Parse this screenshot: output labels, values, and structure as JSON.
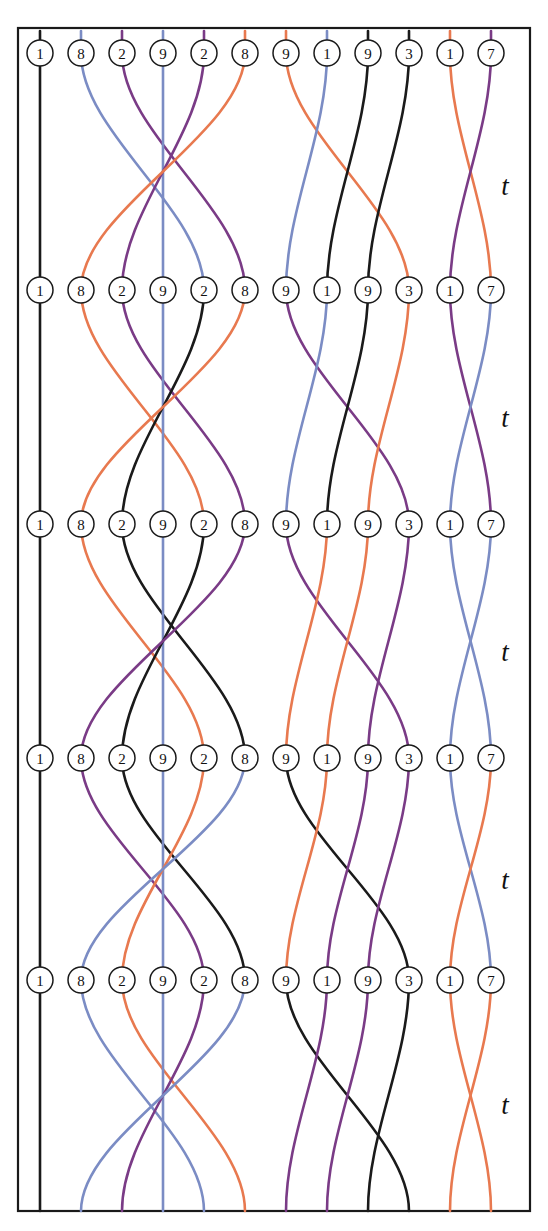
{
  "figure": {
    "width": 548,
    "height": 1231,
    "background": "#ffffff",
    "frame": {
      "x": 18,
      "y": 28,
      "width": 512,
      "height": 1183,
      "stroke": "#1a1a1a"
    }
  },
  "palette": {
    "black": "#1a1a1a",
    "blue": "#7b8cc4",
    "purple": "#7a3b86",
    "orange": "#e8794f"
  },
  "layout": {
    "columns_x": [
      40,
      81,
      122,
      163,
      204,
      245,
      286,
      327,
      368,
      409,
      450,
      491
    ],
    "rows_y": [
      53,
      290,
      524,
      758,
      980
    ],
    "column_count": 12,
    "row_count": 5,
    "node_radius": 13
  },
  "time_labels": [
    {
      "text": "t",
      "x": 505,
      "y": 186
    },
    {
      "text": "t",
      "x": 505,
      "y": 418
    },
    {
      "text": "t",
      "x": 505,
      "y": 652
    },
    {
      "text": "t",
      "x": 505,
      "y": 880
    },
    {
      "text": "t",
      "x": 505,
      "y": 1105
    }
  ],
  "node_values": [
    "1",
    "8",
    "2",
    "9",
    "2",
    "8",
    "9",
    "1",
    "9",
    "3",
    "1",
    "7"
  ],
  "rows": [
    {
      "index": 0,
      "y": 53,
      "labels": [
        "1",
        "8",
        "2",
        "9",
        "2",
        "8",
        "9",
        "1",
        "9",
        "3",
        "1",
        "7"
      ],
      "strand_colors": [
        "black",
        "blue",
        "purple",
        "blue",
        "purple",
        "orange",
        "orange",
        "blue",
        "black",
        "black",
        "orange",
        "purple"
      ]
    },
    {
      "index": 1,
      "y": 290,
      "labels": [
        "1",
        "8",
        "2",
        "9",
        "2",
        "8",
        "9",
        "1",
        "9",
        "3",
        "1",
        "7"
      ],
      "strand_colors": [
        "black",
        "orange",
        "purple",
        "blue",
        "black",
        "orange",
        "purple",
        "blue",
        "black",
        "orange",
        "purple",
        "blue"
      ]
    },
    {
      "index": 2,
      "y": 524,
      "labels": [
        "1",
        "8",
        "2",
        "9",
        "2",
        "8",
        "9",
        "1",
        "9",
        "3",
        "1",
        "7"
      ],
      "strand_colors": [
        "black",
        "orange",
        "black",
        "blue",
        "black",
        "purple",
        "purple",
        "orange",
        "orange",
        "purple",
        "blue",
        "blue"
      ]
    },
    {
      "index": 3,
      "y": 758,
      "labels": [
        "1",
        "8",
        "2",
        "9",
        "2",
        "8",
        "9",
        "1",
        "9",
        "3",
        "1",
        "7"
      ],
      "strand_colors": [
        "black",
        "purple",
        "black",
        "blue",
        "orange",
        "blue",
        "black",
        "orange",
        "purple",
        "purple",
        "blue",
        "orange"
      ]
    },
    {
      "index": 4,
      "y": 980,
      "labels": [
        "1",
        "8",
        "2",
        "9",
        "2",
        "8",
        "9",
        "1",
        "9",
        "3",
        "1",
        "7"
      ],
      "strand_colors": [
        "black",
        "blue",
        "orange",
        "blue",
        "purple",
        "blue",
        "black",
        "purple",
        "purple",
        "black",
        "orange",
        "orange"
      ]
    }
  ],
  "segments": [
    {
      "index": 0,
      "y_top": 53,
      "y_bottom": 290,
      "strands": [
        {
          "from": 0,
          "to": 0,
          "color": "black"
        },
        {
          "from": 1,
          "to": 4,
          "color": "blue"
        },
        {
          "from": 2,
          "to": 5,
          "color": "purple"
        },
        {
          "from": 3,
          "to": 3,
          "color": "blue"
        },
        {
          "from": 4,
          "to": 2,
          "color": "purple"
        },
        {
          "from": 5,
          "to": 1,
          "color": "orange"
        },
        {
          "from": 6,
          "to": 9,
          "color": "orange"
        },
        {
          "from": 7,
          "to": 6,
          "color": "blue"
        },
        {
          "from": 8,
          "to": 7,
          "color": "black"
        },
        {
          "from": 9,
          "to": 8,
          "color": "black"
        },
        {
          "from": 10,
          "to": 11,
          "color": "orange"
        },
        {
          "from": 11,
          "to": 10,
          "color": "purple"
        }
      ]
    },
    {
      "index": 1,
      "y_top": 290,
      "y_bottom": 524,
      "strands": [
        {
          "from": 0,
          "to": 0,
          "color": "black"
        },
        {
          "from": 1,
          "to": 4,
          "color": "orange"
        },
        {
          "from": 2,
          "to": 5,
          "color": "purple"
        },
        {
          "from": 3,
          "to": 3,
          "color": "blue"
        },
        {
          "from": 4,
          "to": 2,
          "color": "black"
        },
        {
          "from": 5,
          "to": 1,
          "color": "orange"
        },
        {
          "from": 6,
          "to": 9,
          "color": "purple"
        },
        {
          "from": 7,
          "to": 6,
          "color": "blue"
        },
        {
          "from": 8,
          "to": 7,
          "color": "black"
        },
        {
          "from": 9,
          "to": 8,
          "color": "orange"
        },
        {
          "from": 10,
          "to": 11,
          "color": "purple"
        },
        {
          "from": 11,
          "to": 10,
          "color": "blue"
        }
      ]
    },
    {
      "index": 2,
      "y_top": 524,
      "y_bottom": 758,
      "strands": [
        {
          "from": 0,
          "to": 0,
          "color": "black"
        },
        {
          "from": 1,
          "to": 4,
          "color": "orange"
        },
        {
          "from": 2,
          "to": 5,
          "color": "black"
        },
        {
          "from": 3,
          "to": 3,
          "color": "blue"
        },
        {
          "from": 4,
          "to": 2,
          "color": "black"
        },
        {
          "from": 5,
          "to": 1,
          "color": "purple"
        },
        {
          "from": 6,
          "to": 9,
          "color": "purple"
        },
        {
          "from": 7,
          "to": 6,
          "color": "orange"
        },
        {
          "from": 8,
          "to": 7,
          "color": "orange"
        },
        {
          "from": 9,
          "to": 8,
          "color": "purple"
        },
        {
          "from": 10,
          "to": 11,
          "color": "blue"
        },
        {
          "from": 11,
          "to": 10,
          "color": "blue"
        }
      ]
    },
    {
      "index": 3,
      "y_top": 758,
      "y_bottom": 980,
      "strands": [
        {
          "from": 0,
          "to": 0,
          "color": "black"
        },
        {
          "from": 1,
          "to": 4,
          "color": "purple"
        },
        {
          "from": 2,
          "to": 5,
          "color": "black"
        },
        {
          "from": 3,
          "to": 3,
          "color": "blue"
        },
        {
          "from": 4,
          "to": 2,
          "color": "orange"
        },
        {
          "from": 5,
          "to": 1,
          "color": "blue"
        },
        {
          "from": 6,
          "to": 9,
          "color": "black"
        },
        {
          "from": 7,
          "to": 6,
          "color": "orange"
        },
        {
          "from": 8,
          "to": 7,
          "color": "purple"
        },
        {
          "from": 9,
          "to": 8,
          "color": "purple"
        },
        {
          "from": 10,
          "to": 11,
          "color": "blue"
        },
        {
          "from": 11,
          "to": 10,
          "color": "orange"
        }
      ]
    },
    {
      "index": 4,
      "y_top": 980,
      "y_bottom": 1211,
      "strands": [
        {
          "from": 0,
          "to": 0,
          "color": "black"
        },
        {
          "from": 1,
          "to": 4,
          "color": "blue"
        },
        {
          "from": 2,
          "to": 5,
          "color": "orange"
        },
        {
          "from": 3,
          "to": 3,
          "color": "blue"
        },
        {
          "from": 4,
          "to": 2,
          "color": "purple"
        },
        {
          "from": 5,
          "to": 1,
          "color": "blue"
        },
        {
          "from": 6,
          "to": 9,
          "color": "black"
        },
        {
          "from": 7,
          "to": 6,
          "color": "purple"
        },
        {
          "from": 8,
          "to": 7,
          "color": "purple"
        },
        {
          "from": 9,
          "to": 8,
          "color": "black"
        },
        {
          "from": 10,
          "to": 11,
          "color": "orange"
        },
        {
          "from": 11,
          "to": 10,
          "color": "orange"
        }
      ]
    }
  ],
  "stub": {
    "top_length": 22,
    "bottom_length": 22
  }
}
